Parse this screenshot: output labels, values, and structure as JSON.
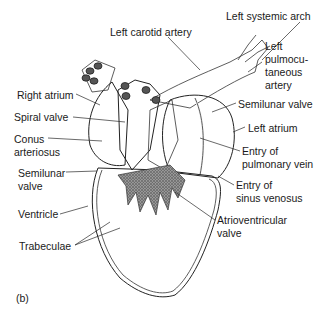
{
  "figure": {
    "panel_label": "(b)",
    "colors": {
      "ink": "#1a1a1a",
      "stipple_dark": "#8a8a8a",
      "stipple_light": "#d9d9d9",
      "background": "#ffffff"
    }
  },
  "labels": {
    "left_carotid_artery": "Left carotid artery",
    "left_systemic_arch": "Left systemic arch",
    "left_pulmocutaneous_artery": [
      "Left",
      "pulmocu-",
      "taneous",
      "artery"
    ],
    "semilunar_valve_right": "Semilunar valve",
    "left_atrium": "Left atrium",
    "entry_pulmonary_vein": [
      "Entry of",
      "pulmonary vein"
    ],
    "entry_sinus_venosus": [
      "Entry of",
      "sinus venosus"
    ],
    "atrioventricular_valve": [
      "Atrioventricular",
      "valve"
    ],
    "right_atrium": "Right atrium",
    "spiral_valve": "Spiral valve",
    "conus_arteriosus": [
      "Conus",
      "arteriosus"
    ],
    "semilunar_valve_left": [
      "Semilunar",
      "valve"
    ],
    "ventricle": "Ventricle",
    "trabeculae": "Trabeculae"
  }
}
